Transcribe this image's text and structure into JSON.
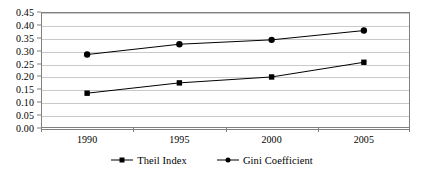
{
  "chart_data": {
    "type": "line",
    "title": "",
    "subtitle": "",
    "xlabel": "",
    "ylabel": "",
    "categories": [
      "1990",
      "1995",
      "2000",
      "2005"
    ],
    "series": [
      {
        "name": "Theil Index",
        "marker": "square",
        "color": "#000000",
        "values": [
          0.135,
          0.175,
          0.198,
          0.255
        ]
      },
      {
        "name": "Gini Coefficient",
        "marker": "circle",
        "color": "#000000",
        "values": [
          0.285,
          0.325,
          0.342,
          0.378
        ]
      }
    ],
    "ylim": [
      0.0,
      0.45
    ],
    "ytick_step": 0.05,
    "ytick_labels": [
      "0.45",
      "0.40",
      "0.35",
      "0.30",
      "0.25",
      "0.20",
      "0.15",
      "0.10",
      "0.05",
      "0.00"
    ],
    "ytick_values": [
      0.45,
      0.4,
      0.35,
      0.3,
      0.25,
      0.2,
      0.15,
      0.1,
      0.05,
      0.0
    ],
    "grid": true,
    "grid_axis": "y",
    "legend_position": "bottom",
    "legend_orientation": "horizontal",
    "plot_background": "#ffffff",
    "grid_color": "#c9c9c9",
    "frame_color": "#808080",
    "axis_text_color": "#000000"
  },
  "legend": {
    "entries": [
      {
        "label": "Theil Index"
      },
      {
        "label": "Gini Coefficient"
      }
    ]
  }
}
